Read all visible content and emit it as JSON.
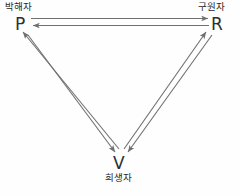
{
  "figure": {
    "background_color": "#fefefe",
    "line_color": "#6f6f6f",
    "text_color": "#2e2e2e",
    "caption": "사람들의 관계와 심리현상"
  },
  "nodes": [
    {
      "id": "P",
      "letter": "P",
      "role_label": "박해자",
      "position": "top-left"
    },
    {
      "id": "R",
      "letter": "R",
      "role_label": "구원자",
      "position": "top-right"
    },
    {
      "id": "V",
      "letter": "V",
      "role_label": "희생자",
      "position": "bottom-center"
    }
  ],
  "edges": [
    {
      "id": "p-to-r",
      "from": "P",
      "to": "R",
      "direction": "right"
    },
    {
      "id": "r-to-p",
      "from": "R",
      "to": "P",
      "direction": "left"
    },
    {
      "id": "p-to-v",
      "from": "P",
      "to": "V",
      "direction": "down-right"
    },
    {
      "id": "v-to-p",
      "from": "V",
      "to": "P",
      "direction": "up-left"
    },
    {
      "id": "r-to-v",
      "from": "R",
      "to": "V",
      "direction": "down-left"
    },
    {
      "id": "v-to-r",
      "from": "V",
      "to": "R",
      "direction": "up-right"
    }
  ]
}
